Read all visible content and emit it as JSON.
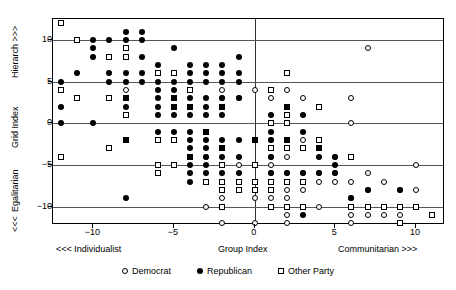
{
  "chart_data": {
    "type": "scatter",
    "title": "",
    "xlabel": "Group Index",
    "ylabel": "Grid Index",
    "xlim": [
      -12.5,
      11.8
    ],
    "ylim": [
      -12.2,
      12.5
    ],
    "xticks": [
      -10,
      -5,
      0,
      5,
      10
    ],
    "xtick_labels": [
      "−10",
      "−5",
      "0",
      "5",
      "10"
    ],
    "yticks": [
      10,
      5,
      0,
      -5,
      -10
    ],
    "ytick_labels": [
      "10",
      "5",
      "0",
      "−5",
      "−10"
    ],
    "grid": "horizontal gridlines at y = 10, 5, 0, -5, -10; vertical line at x = 0",
    "legend_position": "below-center",
    "axis_captions": {
      "x_left": "<<< Individualist",
      "x_center": "Group Index",
      "x_right": "Communitarian >>>",
      "y_top": "Hierarch >>>",
      "y_middle": "Grid Index",
      "y_lower": "Egalitarian",
      "y_bottom": "<<<"
    },
    "series": [
      {
        "name": "Democrat",
        "marker": "open-circle",
        "color": "#000000",
        "points": [
          [
            -8,
            4
          ],
          [
            -4,
            2
          ],
          [
            -4,
            -4
          ],
          [
            -3,
            -4
          ],
          [
            -2,
            4
          ],
          [
            -2,
            3
          ],
          [
            -1,
            3
          ],
          [
            -1,
            -5
          ],
          [
            -2,
            -9
          ],
          [
            -3,
            -10
          ],
          [
            -2,
            -10
          ],
          [
            -2,
            -12
          ],
          [
            0,
            4
          ],
          [
            0,
            -5
          ],
          [
            0,
            -7
          ],
          [
            0,
            -9
          ],
          [
            0,
            -12
          ],
          [
            1,
            3
          ],
          [
            1,
            4
          ],
          [
            1,
            -2
          ],
          [
            1,
            -3
          ],
          [
            1,
            -4
          ],
          [
            1,
            -5
          ],
          [
            1,
            -6
          ],
          [
            1,
            -7
          ],
          [
            1,
            -8
          ],
          [
            1,
            -9
          ],
          [
            2,
            4
          ],
          [
            2,
            -3
          ],
          [
            2,
            -4
          ],
          [
            2,
            -6
          ],
          [
            2,
            -7
          ],
          [
            2,
            -8
          ],
          [
            2,
            -9
          ],
          [
            2,
            -11
          ],
          [
            2,
            -12
          ],
          [
            3,
            3
          ],
          [
            3,
            -2
          ],
          [
            3,
            -3
          ],
          [
            3,
            -6
          ],
          [
            3,
            -7
          ],
          [
            3,
            -8
          ],
          [
            3,
            -10
          ],
          [
            4,
            -3
          ],
          [
            4,
            -6
          ],
          [
            4,
            -7
          ],
          [
            4,
            -10
          ],
          [
            5,
            -4
          ],
          [
            5,
            -6
          ],
          [
            5,
            -7
          ],
          [
            6,
            3
          ],
          [
            6,
            0
          ],
          [
            6,
            -7
          ],
          [
            6,
            -9
          ],
          [
            6,
            -11
          ],
          [
            6,
            -12
          ],
          [
            7,
            9
          ],
          [
            7,
            -6
          ],
          [
            7,
            -8
          ],
          [
            7,
            -11
          ],
          [
            8,
            -7
          ],
          [
            8,
            -11
          ],
          [
            9,
            -8
          ],
          [
            9,
            -11
          ],
          [
            10,
            -5
          ],
          [
            10,
            -8
          ]
        ]
      },
      {
        "name": "Republican",
        "marker": "filled-circle",
        "color": "#000000",
        "points": [
          [
            -12,
            5
          ],
          [
            -12,
            2
          ],
          [
            -12,
            0
          ],
          [
            -11,
            6
          ],
          [
            -10,
            10
          ],
          [
            -10,
            9
          ],
          [
            -10,
            8
          ],
          [
            -10,
            0
          ],
          [
            -9,
            10
          ],
          [
            -9,
            6
          ],
          [
            -9,
            5
          ],
          [
            -8,
            11
          ],
          [
            -8,
            10
          ],
          [
            -8,
            6
          ],
          [
            -8,
            5
          ],
          [
            -8,
            3
          ],
          [
            -8,
            2
          ],
          [
            -8,
            -2
          ],
          [
            -8,
            -9
          ],
          [
            -7,
            11
          ],
          [
            -7,
            10
          ],
          [
            -7,
            8
          ],
          [
            -7,
            6
          ],
          [
            -7,
            5
          ],
          [
            -6,
            7
          ],
          [
            -6,
            5
          ],
          [
            -6,
            4
          ],
          [
            -6,
            3
          ],
          [
            -6,
            2
          ],
          [
            -6,
            1
          ],
          [
            -6,
            -1
          ],
          [
            -5,
            9
          ],
          [
            -5,
            5
          ],
          [
            -5,
            4
          ],
          [
            -5,
            3
          ],
          [
            -5,
            2
          ],
          [
            -5,
            1
          ],
          [
            -5,
            -1
          ],
          [
            -4,
            7
          ],
          [
            -4,
            6
          ],
          [
            -4,
            5
          ],
          [
            -4,
            3
          ],
          [
            -4,
            2
          ],
          [
            -4,
            1
          ],
          [
            -4,
            -1
          ],
          [
            -4,
            -2
          ],
          [
            -4,
            -3
          ],
          [
            -4,
            -4
          ],
          [
            -4,
            -5
          ],
          [
            -4,
            -6
          ],
          [
            -4,
            -7
          ],
          [
            -3,
            7
          ],
          [
            -3,
            6
          ],
          [
            -3,
            5
          ],
          [
            -3,
            3
          ],
          [
            -3,
            2
          ],
          [
            -3,
            1
          ],
          [
            -3,
            -1
          ],
          [
            -3,
            -2
          ],
          [
            -3,
            -3
          ],
          [
            -3,
            -4
          ],
          [
            -3,
            -5
          ],
          [
            -3,
            -6
          ],
          [
            -2,
            7
          ],
          [
            -2,
            6
          ],
          [
            -2,
            5
          ],
          [
            -2,
            3
          ],
          [
            -2,
            2
          ],
          [
            -2,
            1
          ],
          [
            -2,
            -2
          ],
          [
            -2,
            -3
          ],
          [
            -2,
            -4
          ],
          [
            -2,
            -6
          ],
          [
            -1,
            8
          ],
          [
            -1,
            6
          ],
          [
            -1,
            5
          ],
          [
            -1,
            3
          ],
          [
            -1,
            -2
          ],
          [
            -1,
            -4
          ],
          [
            -1,
            -6
          ],
          [
            0,
            -2
          ],
          [
            1,
            1
          ],
          [
            1,
            -1
          ],
          [
            1,
            -2
          ],
          [
            1,
            -4
          ],
          [
            1,
            -6
          ],
          [
            2,
            2
          ],
          [
            2,
            -2
          ],
          [
            2,
            -6
          ],
          [
            3,
            1
          ],
          [
            3,
            -1
          ],
          [
            3,
            -6
          ],
          [
            3,
            -11
          ],
          [
            4,
            -3
          ],
          [
            4,
            -4
          ],
          [
            4,
            -6
          ],
          [
            5,
            -4
          ],
          [
            5,
            -5
          ],
          [
            5,
            -6
          ],
          [
            6,
            -9
          ],
          [
            7,
            -8
          ],
          [
            9,
            -8
          ]
        ]
      },
      {
        "name": "Other Party",
        "marker": "open-square",
        "color": "#000000",
        "points": [
          [
            -12,
            12
          ],
          [
            -12,
            4
          ],
          [
            -12,
            -4
          ],
          [
            -11,
            10
          ],
          [
            -11,
            3
          ],
          [
            -9,
            8
          ],
          [
            -9,
            3
          ],
          [
            -8,
            9
          ],
          [
            -8,
            8
          ],
          [
            -8,
            3
          ],
          [
            -8,
            1
          ],
          [
            -8,
            -2
          ],
          [
            -9,
            -3
          ],
          [
            -6,
            6
          ],
          [
            -6,
            -2
          ],
          [
            -6,
            -5
          ],
          [
            -6,
            -6
          ],
          [
            -5,
            6
          ],
          [
            -5,
            3
          ],
          [
            -5,
            2
          ],
          [
            -5,
            -2
          ],
          [
            -5,
            -5
          ],
          [
            -4,
            4
          ],
          [
            -4,
            2
          ],
          [
            -4,
            -4
          ],
          [
            -3,
            -1
          ],
          [
            -3,
            -7
          ],
          [
            -2,
            2
          ],
          [
            -2,
            -3
          ],
          [
            -2,
            -5
          ],
          [
            -2,
            -7
          ],
          [
            -2,
            -8
          ],
          [
            -2,
            -10
          ],
          [
            -1,
            -7
          ],
          [
            -1,
            -8
          ],
          [
            0,
            -2
          ],
          [
            0,
            -5
          ],
          [
            0,
            -7
          ],
          [
            0,
            -8
          ],
          [
            1,
            4
          ],
          [
            1,
            0
          ],
          [
            1,
            -3
          ],
          [
            1,
            -7
          ],
          [
            1,
            -8
          ],
          [
            1,
            -10
          ],
          [
            2,
            6
          ],
          [
            2,
            2
          ],
          [
            2,
            1
          ],
          [
            2,
            0
          ],
          [
            2,
            -2
          ],
          [
            2,
            -3
          ],
          [
            2,
            -7
          ],
          [
            2,
            -10
          ],
          [
            3,
            -3
          ],
          [
            3,
            -7
          ],
          [
            3,
            -10
          ],
          [
            4,
            2
          ],
          [
            4,
            -2
          ],
          [
            4,
            -3
          ],
          [
            6,
            -4
          ],
          [
            6,
            -10
          ],
          [
            7,
            -10
          ],
          [
            8,
            -10
          ],
          [
            9,
            -10
          ],
          [
            9,
            -12
          ],
          [
            10,
            -10
          ],
          [
            11,
            -11
          ]
        ]
      }
    ]
  },
  "legend": {
    "items": [
      {
        "label": "Democrat",
        "marker": "open-circle"
      },
      {
        "label": "Republican",
        "marker": "filled-circle"
      },
      {
        "label": "Other Party",
        "marker": "open-square"
      }
    ]
  }
}
